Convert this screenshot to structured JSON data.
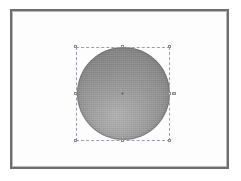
{
  "canvas": {
    "width": 241,
    "height": 181,
    "background_color": "#ffffff",
    "label": "Image canvas"
  },
  "document_frame": {
    "label": "Document page",
    "border_color": "#6e6e6e",
    "inner_border_color": "#b9b9b9",
    "page_color": "#fdfdfd",
    "x": 10,
    "y": 9,
    "width": 219,
    "height": 160
  },
  "object": {
    "name": "sphere",
    "label": "Sphere",
    "shape": "circle",
    "fill_style": "radial-gradient",
    "highlight_position": "lower-center-left",
    "light_color": "#b4b4b4",
    "mid_color": "#969696",
    "dark_color": "#767676",
    "outline_color": "#646464",
    "x": 77,
    "y": 47,
    "width": 93,
    "height": 93
  },
  "selection": {
    "label": "Selection bounding box",
    "state": "selected",
    "border_color": "#9aa0ab",
    "border_style": "dashed",
    "x": 76,
    "y": 47,
    "width": 94,
    "height": 94,
    "handle_fill": "#ffffff",
    "handle_border": "#8b8b8b",
    "handles": [
      {
        "id": "tl",
        "label": "Top left resize handle"
      },
      {
        "id": "tm",
        "label": "Top center resize handle"
      },
      {
        "id": "tr",
        "label": "Top right resize handle"
      },
      {
        "id": "ml",
        "label": "Middle left resize handle"
      },
      {
        "id": "mr",
        "label": "Middle right resize handle"
      },
      {
        "id": "bl",
        "label": "Bottom left resize handle"
      },
      {
        "id": "bm",
        "label": "Bottom center resize handle"
      },
      {
        "id": "br",
        "label": "Bottom right resize handle"
      }
    ],
    "extra_handle": {
      "id": "extra",
      "label": "Rotation handle"
    },
    "center_marker": {
      "label": "Object center point"
    }
  }
}
